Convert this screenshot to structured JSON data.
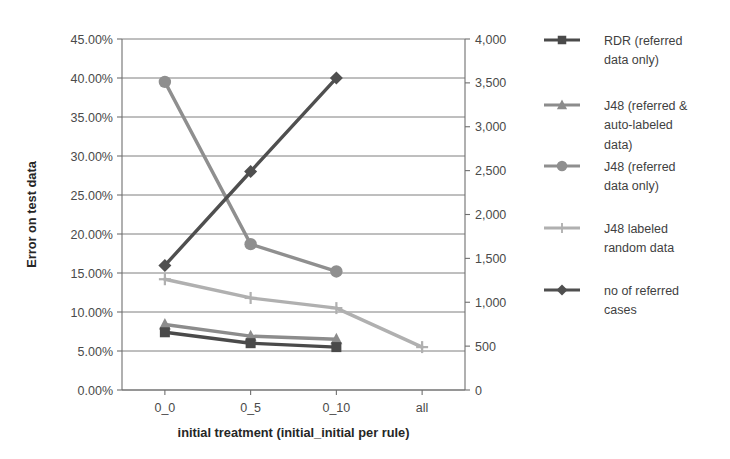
{
  "chart_data": {
    "type": "line",
    "title": "",
    "xlabel": "initial treatment (initial_initial per rule)",
    "ylabel": "Error on test data",
    "y2label": "",
    "categories": [
      "0_0",
      "0_5",
      "0_10",
      "all"
    ],
    "ylim": [
      0,
      45
    ],
    "ytick_labels": [
      "0.00%",
      "5.00%",
      "10.00%",
      "15.00%",
      "20.00%",
      "25.00%",
      "30.00%",
      "35.00%",
      "40.00%",
      "45.00%"
    ],
    "ytick_values": [
      0,
      5,
      10,
      15,
      20,
      25,
      30,
      35,
      40,
      45
    ],
    "y2lim": [
      0,
      4000
    ],
    "y2tick_labels": [
      "0",
      "500",
      "1,000",
      "1,500",
      "2,000",
      "2,500",
      "3,000",
      "3,500",
      "4,000"
    ],
    "y2tick_values": [
      0,
      500,
      1000,
      1500,
      2000,
      2500,
      3000,
      3500,
      4000
    ],
    "grid": true,
    "legend_position": "right",
    "series": [
      {
        "name": "RDR (referred data only)",
        "legend_label_lines": [
          "RDR (referred",
          "data only)"
        ],
        "marker": "square",
        "color": "#4a4a4a",
        "axis": "left",
        "values": [
          7.4,
          6.0,
          5.5,
          null
        ]
      },
      {
        "name": "J48 (referred & auto-labeled data)",
        "legend_label_lines": [
          "J48 (referred &",
          "auto-labeled",
          "data)"
        ],
        "marker": "triangle",
        "color": "#8c8c8c",
        "axis": "left",
        "values": [
          8.4,
          6.9,
          6.5,
          null
        ]
      },
      {
        "name": "J48 (referred data only)",
        "legend_label_lines": [
          "J48 (referred",
          "data only)"
        ],
        "marker": "circle",
        "color": "#8f8f8f",
        "axis": "left",
        "values": [
          39.5,
          18.7,
          15.2,
          null
        ]
      },
      {
        "name": "J48 labeled random data",
        "legend_label_lines": [
          "J48 labeled",
          "random data"
        ],
        "marker": "plus",
        "color": "#b0b0b0",
        "axis": "left",
        "values": [
          14.2,
          11.8,
          10.5,
          5.5
        ]
      },
      {
        "name": "no of referred cases",
        "legend_label_lines": [
          "no of referred",
          "cases"
        ],
        "marker": "diamond",
        "color": "#4f4f4f",
        "axis": "right",
        "values": [
          1420,
          2490,
          3555,
          null
        ]
      }
    ]
  },
  "legend": {
    "items": [
      {
        "label": "RDR (referred data only)"
      },
      {
        "label": "J48 (referred & auto-labeled data)"
      },
      {
        "label": "J48 (referred data only)"
      },
      {
        "label": "J48 labeled random data"
      },
      {
        "label": "no of referred cases"
      }
    ]
  }
}
